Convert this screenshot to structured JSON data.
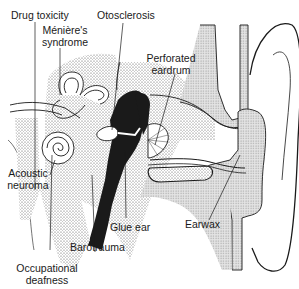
{
  "diagram": {
    "colors": {
      "ink": "#1a1a1a",
      "stipple": "#9a9a9a",
      "bone": "#c8c8c8",
      "background": "#ffffff"
    },
    "labels": {
      "drug_toxicity": "Drug toxicity",
      "meniere_line1": "Ménière's",
      "meniere_line2": "syndrome",
      "otosclerosis": "Otosclerosis",
      "perforated_line1": "Perforated",
      "perforated_line2": "eardrum",
      "acoustic_line1": "Acoustic",
      "acoustic_line2": "neuroma",
      "glue_ear": "Glue ear",
      "earwax": "Earwax",
      "barotrauma": "Barotrauma",
      "occupational_line1": "Occupational",
      "occupational_line2": "deafness"
    }
  }
}
